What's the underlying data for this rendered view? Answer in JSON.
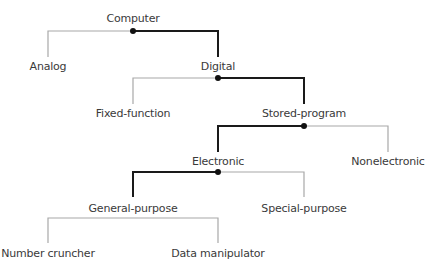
{
  "colors": {
    "bold": "#1a1a1a",
    "thin": "#a8a8a8",
    "dot": "#111111",
    "text": "#3a3a3a"
  },
  "nodes": {
    "computer": {
      "label": "Computer",
      "x": 133,
      "y": 12
    },
    "analog": {
      "label": "Analog",
      "x": 48,
      "y": 60
    },
    "digital": {
      "label": "Digital",
      "x": 218,
      "y": 60
    },
    "fixed_function": {
      "label": "Fixed-function",
      "x": 133,
      "y": 107
    },
    "stored_program": {
      "label": "Stored-program",
      "x": 304,
      "y": 107
    },
    "electronic": {
      "label": "Electronic",
      "x": 218,
      "y": 155
    },
    "nonelectronic": {
      "label": "Nonelectronic",
      "x": 388,
      "y": 155
    },
    "general_purpose": {
      "label": "General-purpose",
      "x": 133,
      "y": 202
    },
    "special_purpose": {
      "label": "Special-purpose",
      "x": 304,
      "y": 202
    },
    "number_cruncher": {
      "label": "Number cruncher",
      "x": 48,
      "y": 247
    },
    "data_manipulator": {
      "label": "Data manipulator",
      "x": 218,
      "y": 247
    }
  }
}
